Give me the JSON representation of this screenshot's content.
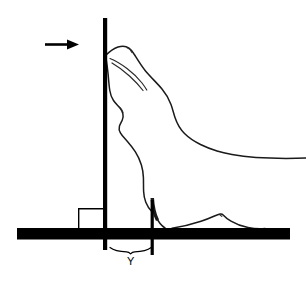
{
  "figure": {
    "title": "",
    "background_color": "#ffffff",
    "width": 306,
    "height": 281,
    "stroke_color": "#1a1a1a",
    "fill_color": "#000000"
  },
  "labels": {
    "measurement_y": "Y"
  },
  "annotations": {
    "direction_arrow": {
      "icon": "arrow-right-icon",
      "points_to": "vertical-barrier",
      "x1": 45,
      "y1": 44,
      "x2": 78,
      "y2": 44
    }
  },
  "elements": {
    "vertical_barrier": {
      "name": "vertical-barrier-post",
      "x": 104,
      "y_top": 18,
      "y_bottom": 250,
      "thickness": 4
    },
    "secondary_post": {
      "name": "rear-measurement-post",
      "x": 152,
      "y_top": 200,
      "y_bottom": 255,
      "thickness": 3
    },
    "ground_bar": {
      "name": "ground-platform-bar",
      "x_left": 17,
      "x_right": 290,
      "y_top": 228,
      "y_bottom": 239
    },
    "step_box": {
      "name": "step-block-outline",
      "x_left": 78,
      "x_right": 104,
      "y_top": 208,
      "y_bottom": 232
    },
    "measurement_brace": {
      "name": "y-measurement-brace",
      "x_left": 110,
      "x_right": 151,
      "y": 250
    }
  },
  "subject": {
    "name": "pinniped-profile-outline",
    "description": "seal side profile rearing against barrier"
  }
}
